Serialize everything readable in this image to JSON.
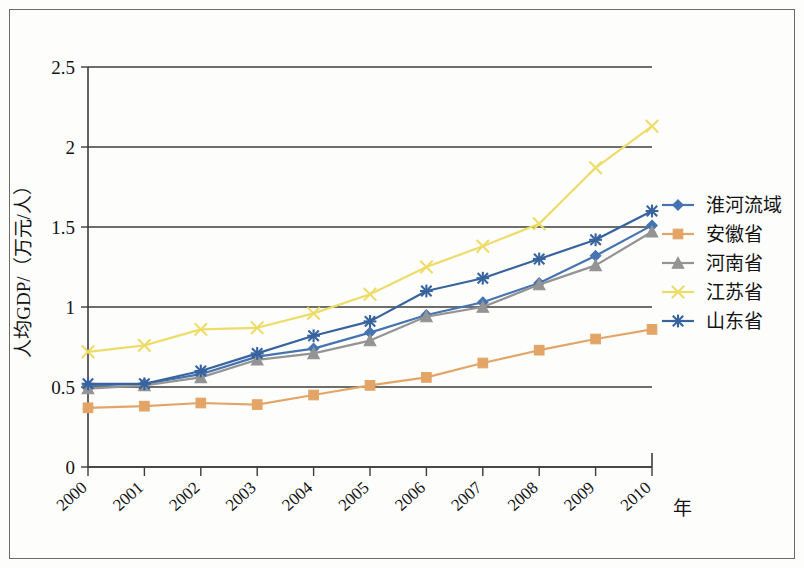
{
  "chart_data": {
    "type": "line",
    "title": "",
    "xlabel": "年",
    "ylabel": "人均GDP/（万元/人）",
    "x": [
      "2000",
      "2001",
      "2002",
      "2003",
      "2004",
      "2005",
      "2006",
      "2007",
      "2008",
      "2009",
      "2010"
    ],
    "categories": [
      "2000",
      "2001",
      "2002",
      "2003",
      "2004",
      "2005",
      "2006",
      "2007",
      "2008",
      "2009",
      "2010"
    ],
    "xlim": [
      2000,
      2010
    ],
    "ylim": [
      0,
      2.5
    ],
    "yticks": [
      "0",
      "0.5",
      "1",
      "1.5",
      "2",
      "2.5"
    ],
    "ytick_values": [
      0,
      0.5,
      1,
      1.5,
      2,
      2.5
    ],
    "grid": true,
    "legend_position": "right",
    "series": [
      {
        "name": "淮河流域",
        "color": "#4674B1",
        "marker": "diamond",
        "values": [
          0.51,
          0.52,
          0.58,
          0.69,
          0.74,
          0.84,
          0.95,
          1.03,
          1.15,
          1.32,
          1.51
        ]
      },
      {
        "name": "安徽省",
        "color": "#E3A567",
        "marker": "square",
        "values": [
          0.37,
          0.38,
          0.4,
          0.39,
          0.45,
          0.51,
          0.56,
          0.65,
          0.73,
          0.8,
          0.86
        ]
      },
      {
        "name": "河南省",
        "color": "#949494",
        "marker": "triangle",
        "values": [
          0.49,
          0.51,
          0.56,
          0.67,
          0.71,
          0.79,
          0.94,
          1.0,
          1.14,
          1.26,
          1.47
        ]
      },
      {
        "name": "江苏省",
        "color": "#EEDC6A",
        "marker": "cross",
        "values": [
          0.72,
          0.76,
          0.86,
          0.87,
          0.96,
          1.08,
          1.25,
          1.38,
          1.52,
          1.87,
          2.13
        ]
      },
      {
        "name": "山东省",
        "color": "#37639E",
        "marker": "asterisk",
        "values": [
          0.52,
          0.52,
          0.6,
          0.71,
          0.82,
          0.91,
          1.1,
          1.18,
          1.3,
          1.42,
          1.6
        ]
      }
    ]
  }
}
